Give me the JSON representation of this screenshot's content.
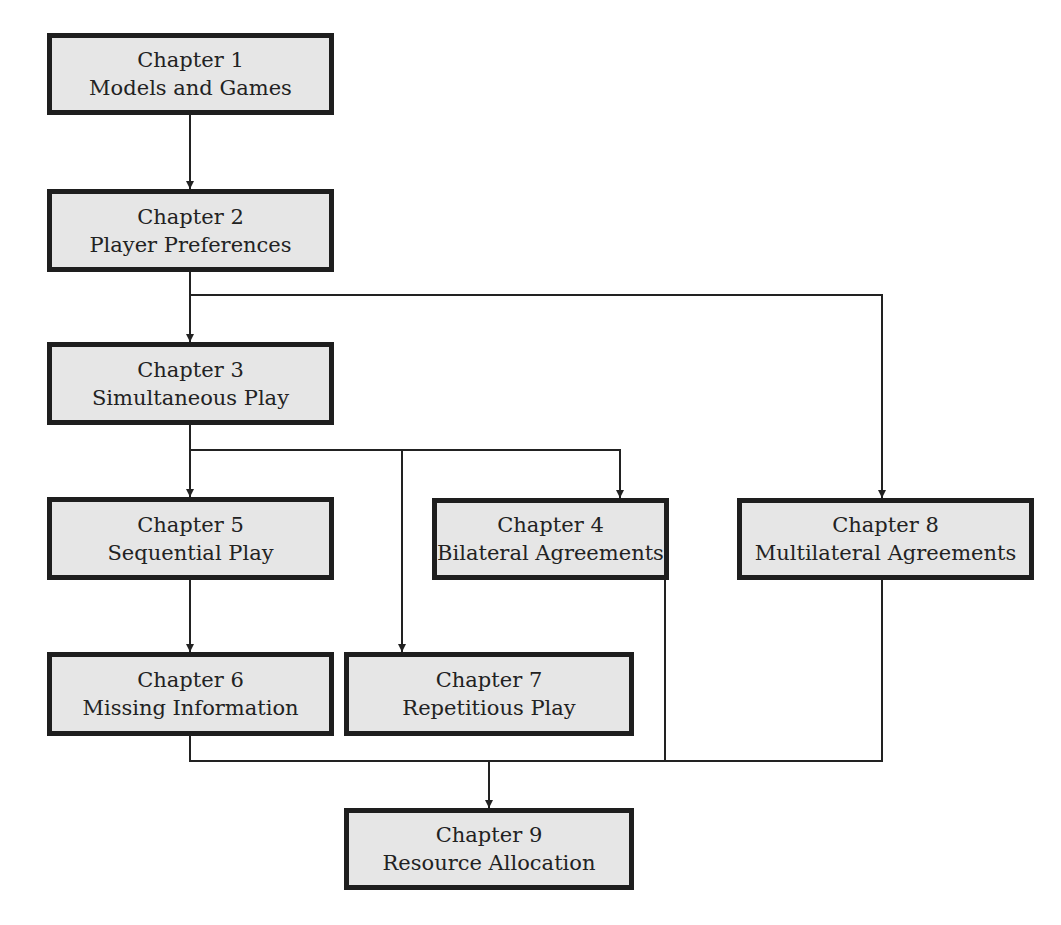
{
  "diagram": {
    "type": "flowchart",
    "colors": {
      "box_fill": "#e6e6e6",
      "box_border": "#1e1e1e",
      "line": "#222222",
      "background": "#ffffff"
    },
    "nodes": [
      {
        "id": "ch1",
        "chapter": "Chapter 1",
        "title": "Models and Games"
      },
      {
        "id": "ch2",
        "chapter": "Chapter 2",
        "title": "Player Preferences"
      },
      {
        "id": "ch3",
        "chapter": "Chapter 3",
        "title": "Simultaneous Play"
      },
      {
        "id": "ch5",
        "chapter": "Chapter 5",
        "title": "Sequential Play"
      },
      {
        "id": "ch4",
        "chapter": "Chapter 4",
        "title": "Bilateral Agreements"
      },
      {
        "id": "ch8",
        "chapter": "Chapter 8",
        "title": "Multilateral Agreements"
      },
      {
        "id": "ch6",
        "chapter": "Chapter 6",
        "title": "Missing Information"
      },
      {
        "id": "ch7",
        "chapter": "Chapter 7",
        "title": "Repetitious Play"
      },
      {
        "id": "ch9",
        "chapter": "Chapter 9",
        "title": "Resource Allocation"
      }
    ],
    "edges": [
      {
        "from": "ch1",
        "to": "ch2"
      },
      {
        "from": "ch2",
        "to": "ch3"
      },
      {
        "from": "ch2",
        "to": "ch8"
      },
      {
        "from": "ch3",
        "to": "ch5"
      },
      {
        "from": "ch3",
        "to": "ch7"
      },
      {
        "from": "ch3",
        "to": "ch4"
      },
      {
        "from": "ch5",
        "to": "ch6"
      },
      {
        "from": "ch6",
        "to": "ch9"
      },
      {
        "from": "ch4",
        "to": "ch9"
      },
      {
        "from": "ch8",
        "to": "ch9"
      }
    ]
  }
}
